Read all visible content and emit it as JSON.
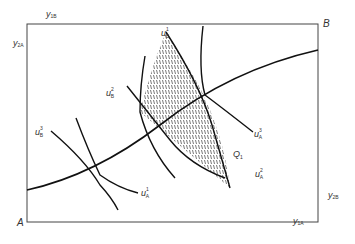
{
  "diagram": {
    "type": "edgeworth-box",
    "corners": {
      "bottom_left": "A",
      "top_right": "B"
    },
    "axis_labels": {
      "top": {
        "base": "y",
        "sub": "1B"
      },
      "left": {
        "base": "y",
        "sub": "2A"
      },
      "right": {
        "base": "y",
        "sub": "2B"
      },
      "bottom": {
        "base": "y",
        "sub": "1A"
      }
    },
    "curve_labels": [
      {
        "base": "u",
        "sup": "1",
        "sub": "B",
        "id": "u1B"
      },
      {
        "base": "u",
        "sup": "2",
        "sub": "B",
        "id": "u2B"
      },
      {
        "base": "u",
        "sup": "3",
        "sub": "B",
        "id": "u3B"
      },
      {
        "base": "u",
        "sup": "1",
        "sub": "A",
        "id": "u1A"
      },
      {
        "base": "u",
        "sup": "2",
        "sub": "A",
        "id": "u2A"
      },
      {
        "base": "u",
        "sup": "3",
        "sub": "A",
        "id": "u3A"
      }
    ],
    "point_label": {
      "base": "Q",
      "sub": "1"
    },
    "colors": {
      "line": "#111111",
      "frame": "#444444",
      "hatch": "#555555",
      "text": "#333333"
    }
  }
}
